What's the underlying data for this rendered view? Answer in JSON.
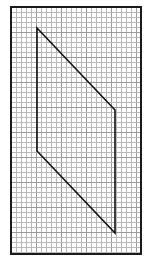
{
  "diagram": {
    "type": "grid-with-shape",
    "canvas": {
      "width": 144,
      "height": 259,
      "background": "#ffffff"
    },
    "grid": {
      "left": 11,
      "top": 7,
      "right": 141,
      "bottom": 254,
      "cell_size": 5,
      "line_color": "#b8b8b8",
      "major_every": 5,
      "major_line_color": "#9a9a9a",
      "border_color": "#1a1a1a",
      "border_width": 2
    },
    "shape": {
      "name": "parallelogram",
      "stroke": "#111111",
      "stroke_width": 1.6,
      "vertices": [
        {
          "label": "top-left",
          "x": 37,
          "y": 28
        },
        {
          "label": "top-right",
          "x": 115,
          "y": 110
        },
        {
          "label": "bottom-right",
          "x": 115,
          "y": 233
        },
        {
          "label": "bottom-left",
          "x": 37,
          "y": 151
        }
      ]
    }
  }
}
